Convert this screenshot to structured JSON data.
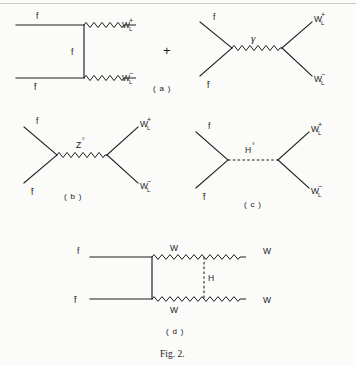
{
  "figure": {
    "caption": "Fig. 2.",
    "plus_separator": "+"
  },
  "panels": [
    {
      "id": "a",
      "label": "( a )",
      "subdiagrams": [
        {
          "id": "a-left",
          "topology": "t-channel-exchange",
          "labels": {
            "in_top": "f",
            "in_bottom": "f̄",
            "internal": "f",
            "out_top_base": "W",
            "out_top_sub": "L",
            "out_top_sup": "+",
            "out_bottom_base": "W",
            "out_bottom_sub": "L",
            "out_bottom_sup": "−"
          }
        },
        {
          "id": "a-right",
          "topology": "s-channel-photon",
          "labels": {
            "in_top": "f",
            "in_bottom": "f̄",
            "internal": "γ",
            "out_top_base": "W",
            "out_top_sub": "L",
            "out_top_sup": "+",
            "out_bottom_base": "W",
            "out_bottom_sub": "L",
            "out_bottom_sup": "−"
          }
        }
      ]
    },
    {
      "id": "b",
      "label": "( b )",
      "subdiagrams": [
        {
          "id": "b-main",
          "topology": "s-channel-z",
          "labels": {
            "in_top": "f",
            "in_bottom": "f̄",
            "internal_base": "Z",
            "internal_sup": "°",
            "out_top_base": "W",
            "out_top_sub": "L",
            "out_top_sup": "+",
            "out_bottom_base": "W",
            "out_bottom_sub": "L",
            "out_bottom_sup": "−"
          }
        }
      ]
    },
    {
      "id": "c",
      "label": "( c )",
      "subdiagrams": [
        {
          "id": "c-main",
          "topology": "s-channel-higgs",
          "labels": {
            "in_top": "f",
            "in_bottom": "f̄",
            "internal_base": "H",
            "internal_sup": "°",
            "out_top_base": "W",
            "out_top_sub": "L",
            "out_top_sup": "+",
            "out_bottom_base": "W",
            "out_bottom_sub": "L",
            "out_bottom_sup": "−"
          }
        }
      ]
    },
    {
      "id": "d",
      "label": "( d )",
      "subdiagrams": [
        {
          "id": "d-main",
          "topology": "box-higgs-exchange",
          "labels": {
            "in_top": "f",
            "in_bottom": "f̄",
            "w_top": "W",
            "w_bottom": "W",
            "internal": "H",
            "out_top": "W",
            "out_bottom": "W"
          }
        }
      ]
    }
  ]
}
